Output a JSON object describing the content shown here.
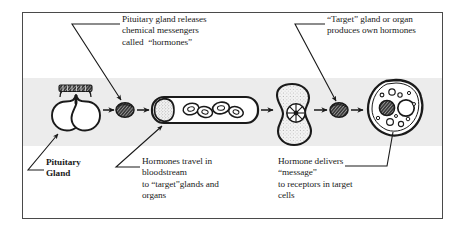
{
  "diagram": {
    "frame": {
      "border_color": "#4a4a4a",
      "background": "#ffffff"
    },
    "band": {
      "background": "#ececec"
    },
    "ink_color": "#1a1a1a",
    "captions": {
      "releases": "Pituitary gland releases\nchemical messengers\ncalled  “hormones”",
      "target_gland": "“Target” gland or organ\nproduces own hormones",
      "pituitary_gland": "Pituitary\nGland",
      "travel": "Hormones travel in\nbloodstream\nto “target”glands and\norgans",
      "message": "Hormone delivers\n“message”\nto receptors in target\ncells"
    },
    "stages": [
      {
        "id": "pituitary-gland",
        "label": "Pituitary gland"
      },
      {
        "id": "hormone-blob-1",
        "label": "Hormone molecule"
      },
      {
        "id": "blood-vessel",
        "label": "Blood vessel with blood cells"
      },
      {
        "id": "target-gland",
        "label": "Target gland with receptors"
      },
      {
        "id": "hormone-blob-2",
        "label": "Hormone produced by target gland"
      },
      {
        "id": "target-cell",
        "label": "Target cell with nucleus and vesicles"
      }
    ],
    "flow_arrows": 5,
    "leader_lines": [
      {
        "id": "leader-releases",
        "arrowhead": true
      },
      {
        "id": "leader-target-gland",
        "arrowhead": true
      },
      {
        "id": "leader-pituitary",
        "arrowhead": true
      },
      {
        "id": "leader-travel",
        "arrowhead": true
      },
      {
        "id": "leader-target-cell",
        "arrowhead": false
      }
    ]
  }
}
